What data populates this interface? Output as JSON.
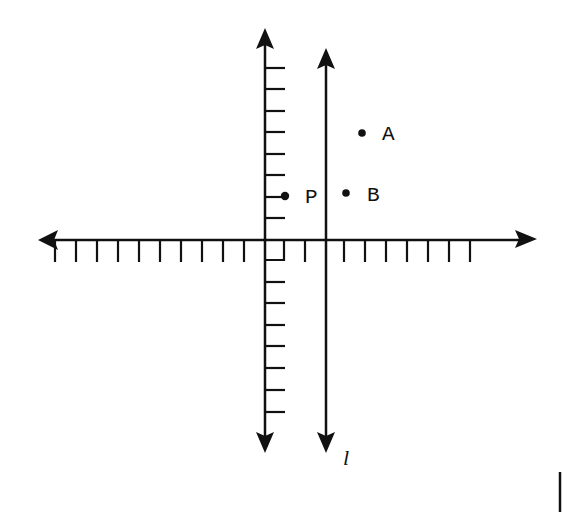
{
  "diagram": {
    "type": "coordinate-plane",
    "colors": {
      "ink": "#111111",
      "background": "#ffffff"
    },
    "x_axis": {
      "tick_count_left": 10,
      "tick_count_right": 10,
      "unit_px": 21.3
    },
    "y_axis": {
      "tick_count_up": 8,
      "tick_count_down": 8,
      "unit_px": 21.5
    },
    "line": {
      "label": "l",
      "x_units": 3,
      "orientation": "vertical"
    },
    "points": [
      {
        "label": "A",
        "x": 4.5,
        "y": 5
      },
      {
        "label": "B",
        "x": 3.8,
        "y": 2.2
      },
      {
        "label": "P",
        "x": 1,
        "y": 2
      }
    ],
    "right_angle_marker": true
  },
  "labels": {
    "A": "A",
    "B": "B",
    "P": "P",
    "l": "l"
  }
}
